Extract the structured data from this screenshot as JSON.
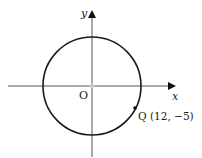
{
  "diagram": {
    "type": "coordinate-circle",
    "axes": {
      "x_label": "x",
      "y_label": "y",
      "origin_label": "O"
    },
    "circle": {
      "center": "O",
      "passes_through": "Q"
    },
    "point": {
      "name": "Q",
      "coords_label": "Q (12, −5)",
      "x": 12,
      "y": -5
    },
    "colors": {
      "stroke": "#1a1a1a",
      "axis": "#444444",
      "background": "#ffffff"
    }
  }
}
